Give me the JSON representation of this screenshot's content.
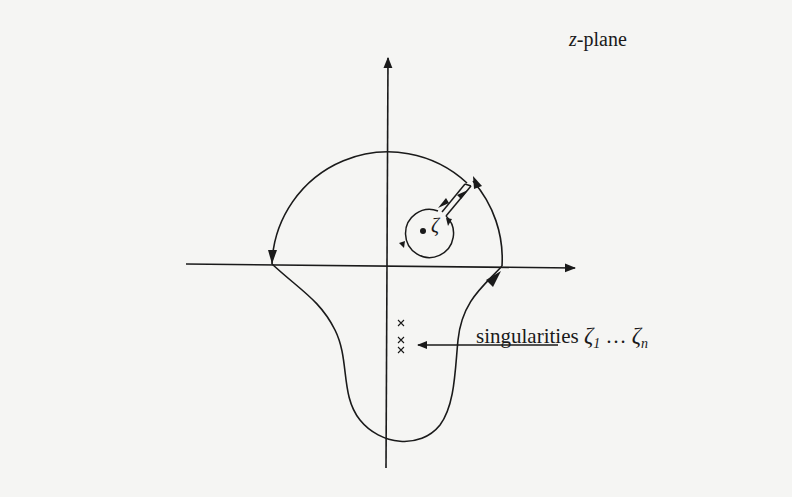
{
  "figure": {
    "plane_label": {
      "variable": "z",
      "suffix": "-plane"
    },
    "point_label": "ζ",
    "singularities_label": {
      "text": "singularities",
      "first_symbol": "ζ",
      "first_subscript": "1",
      "ellipsis": "…",
      "last_symbol": "ζ",
      "last_subscript": "n"
    },
    "singularity_markers": [
      "×",
      "×",
      "×"
    ],
    "colors": {
      "background": "#f5f5f3",
      "ink": "#1a1a1a"
    }
  }
}
